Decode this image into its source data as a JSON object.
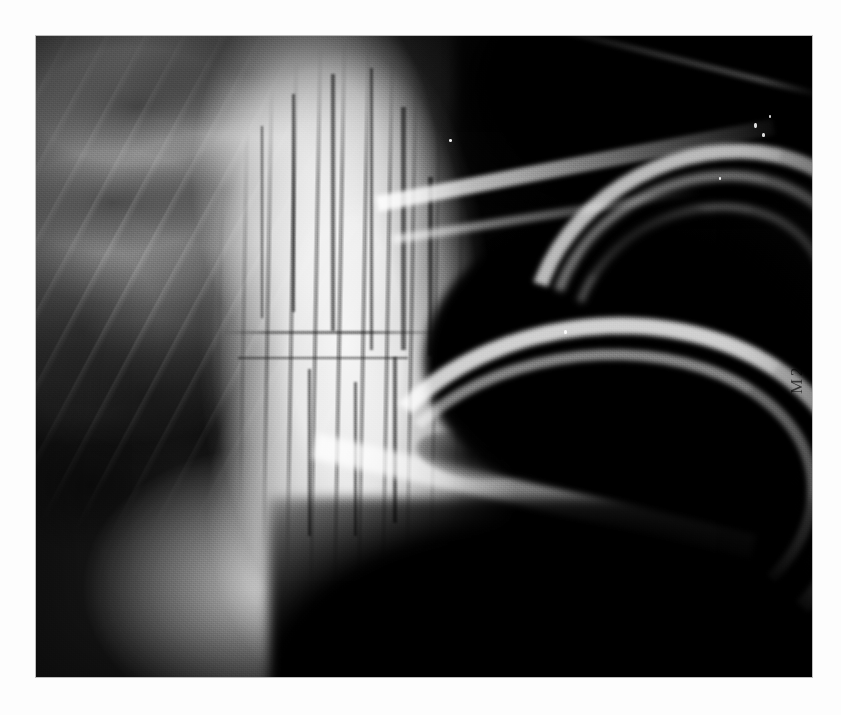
{
  "page": {
    "background_color": "#ffffff",
    "width": 841,
    "height": 715
  },
  "radiograph": {
    "modality_label": "radiograph",
    "view": "lateral",
    "region": "skull / dental",
    "bounds": {
      "x": 36,
      "y": 36,
      "width": 776,
      "height": 641
    },
    "background_color": "#000000",
    "bone_color": "#f2f2f2",
    "soft_tissue_color": "#8a8a8a",
    "air_color": "#000000",
    "edge_marking": "M2(",
    "ghost_caption": ""
  },
  "anatomy": {
    "labels": [
      "cranium",
      "nasal sinuses",
      "maxillary cheek teeth",
      "mandibular cheek teeth",
      "upper incisor",
      "lower incisor",
      "oral cavity",
      "mandibular body",
      "hard palate"
    ]
  }
}
